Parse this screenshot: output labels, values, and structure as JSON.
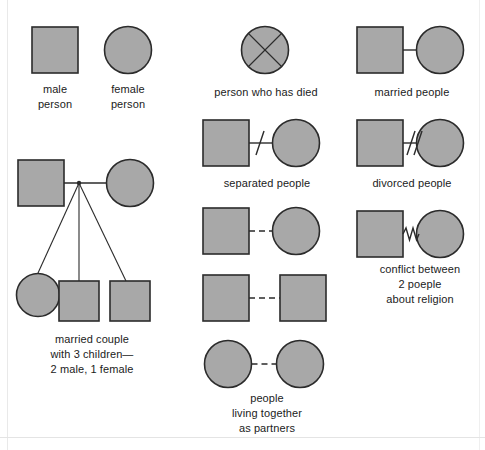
{
  "diagram": {
    "colors": {
      "shape_fill": "#a8a8a8",
      "shape_stroke": "#2b2b2b",
      "line": "#2b2b2b",
      "text": "#1b1b1b",
      "background": "#ffffff",
      "frame": "#e9e9e9"
    },
    "legend": [
      {
        "key": "male-person",
        "label": "male\nperson",
        "symbol": "square",
        "relation": "none"
      },
      {
        "key": "female-person",
        "label": "female\nperson",
        "symbol": "circle",
        "relation": "none"
      },
      {
        "key": "married-couple-with-children",
        "label": "married couple\nwith 3 children—\n2 male, 1 female",
        "symbol": "square-circle-family",
        "relation": "descent-lines",
        "children": [
          "female",
          "male",
          "male"
        ]
      },
      {
        "key": "person-who-has-died",
        "label": "person who has died",
        "symbol": "circle-with-x",
        "relation": "none"
      },
      {
        "key": "separated-people",
        "label": "separated people",
        "symbol": "square-circle",
        "relation": "single-slash"
      },
      {
        "key": "living-together-partners",
        "label": "people\nliving together\nas partners",
        "symbol": "square-circle, square-square, circle-circle",
        "relation": "dashed-line"
      },
      {
        "key": "married-people",
        "label": "married people",
        "symbol": "square-circle",
        "relation": "solid-line"
      },
      {
        "key": "divorced-people",
        "label": "divorced people",
        "symbol": "square-circle",
        "relation": "double-slash"
      },
      {
        "key": "conflict-about-religion",
        "label": "conflict between\n2 poeple\nabout religion",
        "symbol": "square-circle",
        "relation": "zigzag-line"
      }
    ]
  }
}
